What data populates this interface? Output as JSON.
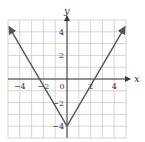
{
  "chart_data": {
    "type": "line",
    "title": "",
    "equation": "y = 2|x| - 4",
    "xlabel": "x",
    "ylabel": "y",
    "xlim": [
      -5,
      5
    ],
    "ylim": [
      -5,
      5
    ],
    "grid": true,
    "x_ticks": [
      -4,
      -2,
      0,
      2,
      4
    ],
    "y_ticks": [
      4,
      2,
      -2,
      -4
    ],
    "x_tick_labels": [
      "−4",
      "−2",
      "0",
      "2",
      "4"
    ],
    "y_tick_labels": [
      "4",
      "2",
      "−2",
      "−4"
    ],
    "series": [
      {
        "name": "V-shaped graph",
        "x": [
          -4.9,
          0,
          4.9
        ],
        "y": [
          4.4,
          -4,
          4.4
        ],
        "arrows": "both-ends",
        "color": "#555555"
      }
    ],
    "key_points": {
      "vertex": [
        0,
        -4
      ],
      "x_intercepts": [
        -2,
        2
      ]
    }
  },
  "labels": {
    "x_axis": "x",
    "y_axis": "y"
  }
}
